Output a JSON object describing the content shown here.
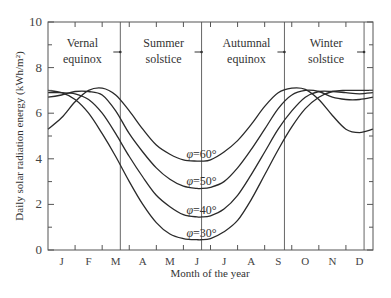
{
  "chart_data": {
    "type": "line",
    "title": "",
    "xlabel": "Month of the year",
    "ylabel": "Daily solar radiation energy (kWh/m²)",
    "ylim": [
      0,
      10
    ],
    "yticks": [
      0,
      2,
      4,
      6,
      8,
      10
    ],
    "grid": false,
    "legend": "inline labels",
    "categories": [
      "J",
      "F",
      "M",
      "A",
      "M",
      "J",
      "J",
      "A",
      "S",
      "O",
      "N",
      "D"
    ],
    "x_unit": "month (0 = Jan 1, 12 = Dec 31)",
    "events": [
      {
        "name": "Vernal equinox",
        "line1": "Vernal",
        "line2": "equinox",
        "x": 2.67
      },
      {
        "name": "Summer solstice",
        "line1": "Summer",
        "line2": "solstice",
        "x": 5.67
      },
      {
        "name": "Autumnal equinox",
        "line1": "Autumnal",
        "line2": "equinox",
        "x": 8.73
      },
      {
        "name": "Winter solstice",
        "line1": "Winter",
        "line2": "solstice",
        "x": 11.67
      }
    ],
    "series": [
      {
        "name": "φ=30°",
        "label_symbol": "φ",
        "label_value": "=30°",
        "x": [
          0,
          0.5,
          1,
          1.5,
          2,
          2.5,
          3,
          3.5,
          4,
          4.5,
          5,
          5.5,
          5.67,
          6,
          6.5,
          7,
          7.5,
          8,
          8.5,
          9,
          9.5,
          10,
          10.5,
          11,
          11.5,
          12
        ],
        "values": [
          7.0,
          6.9,
          6.6,
          6.0,
          5.1,
          4.1,
          3.0,
          2.0,
          1.2,
          0.7,
          0.5,
          0.45,
          0.45,
          0.5,
          0.8,
          1.3,
          2.2,
          3.3,
          4.4,
          5.4,
          6.2,
          6.7,
          6.95,
          7.0,
          7.0,
          7.0
        ]
      },
      {
        "name": "φ=40°",
        "label_symbol": "φ",
        "label_value": "=40°",
        "x": [
          0,
          0.5,
          1,
          1.5,
          2,
          2.5,
          3,
          3.5,
          4,
          4.5,
          5,
          5.5,
          5.67,
          6,
          6.5,
          7,
          7.5,
          8,
          8.5,
          9,
          9.5,
          10,
          10.5,
          11,
          11.5,
          12
        ],
        "values": [
          6.9,
          6.9,
          6.85,
          6.6,
          6.0,
          5.1,
          4.1,
          3.2,
          2.4,
          1.9,
          1.55,
          1.45,
          1.45,
          1.5,
          1.8,
          2.4,
          3.3,
          4.3,
          5.3,
          6.1,
          6.7,
          6.95,
          6.95,
          6.9,
          6.85,
          6.9
        ]
      },
      {
        "name": "φ=50°",
        "label_symbol": "φ",
        "label_value": "=50°",
        "x": [
          0,
          0.5,
          1,
          1.5,
          2,
          2.5,
          3,
          3.5,
          4,
          4.5,
          5,
          5.5,
          5.67,
          6,
          6.5,
          7,
          7.5,
          8,
          8.5,
          9,
          9.5,
          10,
          10.5,
          11,
          11.5,
          12
        ],
        "values": [
          6.7,
          6.8,
          6.95,
          6.95,
          6.8,
          6.1,
          5.1,
          4.3,
          3.6,
          3.1,
          2.8,
          2.7,
          2.7,
          2.75,
          3.0,
          3.6,
          4.4,
          5.3,
          6.2,
          6.8,
          7.0,
          6.95,
          6.7,
          6.6,
          6.6,
          6.7
        ]
      },
      {
        "name": "φ=60°",
        "label_symbol": "φ",
        "label_value": "=60°",
        "x": [
          0,
          0.5,
          1,
          1.5,
          2,
          2.5,
          3,
          3.5,
          4,
          4.5,
          5,
          5.5,
          5.67,
          6,
          6.5,
          7,
          7.5,
          8,
          8.5,
          9,
          9.5,
          10,
          10.5,
          11,
          11.5,
          12
        ],
        "values": [
          5.3,
          5.8,
          6.5,
          7.0,
          7.1,
          6.8,
          6.1,
          5.3,
          4.6,
          4.2,
          3.95,
          3.9,
          3.9,
          3.95,
          4.3,
          4.8,
          5.5,
          6.3,
          6.9,
          7.1,
          7.05,
          6.6,
          5.9,
          5.3,
          5.15,
          5.3
        ]
      }
    ]
  },
  "axes": {
    "ylabel": "Daily solar radiation energy (kWh/m²)",
    "xlabel": "Month of the year",
    "ytick_labels": [
      "0",
      "2",
      "4",
      "6",
      "8",
      "10"
    ],
    "month_labels": [
      "J",
      "F",
      "M",
      "A",
      "M",
      "J",
      "J",
      "A",
      "S",
      "O",
      "N",
      "D"
    ]
  },
  "colors": {
    "line": "#2a2a2a",
    "frame": "#555555",
    "event_line": "#666666",
    "text": "#333333"
  }
}
